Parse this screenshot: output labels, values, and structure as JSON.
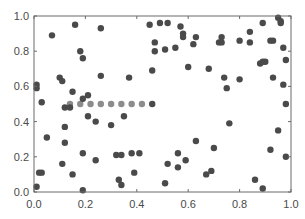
{
  "chart_data": {
    "type": "scatter",
    "title": "",
    "xlabel": "",
    "ylabel": "",
    "xlim": [
      0.0,
      1.0
    ],
    "ylim": [
      0.0,
      1.0
    ],
    "xticks": [
      "0.0",
      "0.2",
      "0.4",
      "0.6",
      "0.8",
      "1.0"
    ],
    "yticks": [
      "0.0",
      "0.2",
      "0.4",
      "0.6",
      "0.8",
      "1.0"
    ],
    "grid": false,
    "legend": null,
    "mirror_ticks": true,
    "series": [
      {
        "name": "random points",
        "color": "#4a4a4a",
        "points": [
          [
            0.16,
            0.95
          ],
          [
            0.07,
            0.89
          ],
          [
            0.26,
            0.93
          ],
          [
            0.18,
            0.8
          ],
          [
            0.19,
            0.76
          ],
          [
            0.1,
            0.65
          ],
          [
            0.11,
            0.63
          ],
          [
            0.26,
            0.66
          ],
          [
            0.01,
            0.61
          ],
          [
            0.01,
            0.59
          ],
          [
            0.15,
            0.57
          ],
          [
            0.21,
            0.55
          ],
          [
            0.19,
            0.53
          ],
          [
            0.03,
            0.51
          ],
          [
            0.45,
            0.95
          ],
          [
            0.49,
            0.96
          ],
          [
            0.52,
            0.96
          ],
          [
            0.57,
            0.94
          ],
          [
            0.58,
            0.9
          ],
          [
            0.58,
            0.88
          ],
          [
            0.63,
            0.88
          ],
          [
            0.47,
            0.85
          ],
          [
            0.62,
            0.84
          ],
          [
            0.47,
            0.8
          ],
          [
            0.51,
            0.81
          ],
          [
            0.55,
            0.82
          ],
          [
            0.46,
            0.69
          ],
          [
            0.6,
            0.71
          ],
          [
            0.37,
            0.65
          ],
          [
            0.89,
            0.96
          ],
          [
            0.95,
            0.99
          ],
          [
            0.96,
            0.97
          ],
          [
            0.96,
            0.96
          ],
          [
            0.84,
            0.91
          ],
          [
            0.73,
            0.88
          ],
          [
            0.72,
            0.85
          ],
          [
            0.73,
            0.85
          ],
          [
            0.8,
            0.86
          ],
          [
            0.84,
            0.85
          ],
          [
            0.92,
            0.86
          ],
          [
            0.93,
            0.86
          ],
          [
            0.97,
            0.82
          ],
          [
            0.98,
            0.75
          ],
          [
            0.88,
            0.73
          ],
          [
            0.89,
            0.74
          ],
          [
            0.9,
            0.74
          ],
          [
            0.68,
            0.7
          ],
          [
            0.74,
            0.65
          ],
          [
            0.8,
            0.64
          ],
          [
            0.93,
            0.65
          ],
          [
            0.75,
            0.59
          ],
          [
            0.97,
            0.61
          ],
          [
            0.98,
            0.5
          ],
          [
            0.46,
            0.5
          ],
          [
            0.12,
            0.48
          ],
          [
            0.14,
            0.48
          ],
          [
            0.21,
            0.43
          ],
          [
            0.24,
            0.4
          ],
          [
            0.3,
            0.38
          ],
          [
            0.12,
            0.37
          ],
          [
            0.05,
            0.31
          ],
          [
            0.12,
            0.28
          ],
          [
            0.19,
            0.22
          ],
          [
            0.32,
            0.21
          ],
          [
            0.24,
            0.18
          ],
          [
            0.11,
            0.16
          ],
          [
            0.02,
            0.11
          ],
          [
            0.03,
            0.11
          ],
          [
            0.15,
            0.1
          ],
          [
            0.33,
            0.07
          ],
          [
            0.01,
            0.03
          ],
          [
            0.19,
            0.01
          ],
          [
            0.35,
            0.43
          ],
          [
            0.34,
            0.21
          ],
          [
            0.38,
            0.22
          ],
          [
            0.41,
            0.22
          ],
          [
            0.39,
            0.11
          ],
          [
            0.34,
            0.04
          ],
          [
            0.63,
            0.29
          ],
          [
            0.56,
            0.22
          ],
          [
            0.59,
            0.18
          ],
          [
            0.52,
            0.16
          ],
          [
            0.56,
            0.14
          ],
          [
            0.51,
            0.05
          ],
          [
            0.76,
            0.39
          ],
          [
            0.95,
            0.35
          ],
          [
            0.7,
            0.25
          ],
          [
            0.92,
            0.24
          ],
          [
            0.98,
            0.2
          ],
          [
            0.69,
            0.12
          ],
          [
            0.67,
            0.1
          ],
          [
            0.86,
            0.07
          ],
          [
            0.89,
            0.02
          ]
        ]
      },
      {
        "name": "line of points at y=0.5",
        "color": "#8c8c8c",
        "points": [
          [
            0.14,
            0.5
          ],
          [
            0.18,
            0.5
          ],
          [
            0.22,
            0.5
          ],
          [
            0.26,
            0.5
          ],
          [
            0.3,
            0.5
          ],
          [
            0.34,
            0.5
          ],
          [
            0.38,
            0.5
          ],
          [
            0.42,
            0.5
          ]
        ]
      }
    ]
  }
}
